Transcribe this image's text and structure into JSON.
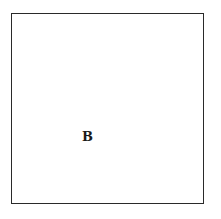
{
  "diagram": {
    "shape": "square",
    "label": "B",
    "colors": {
      "stroke": "#2a2a2a",
      "text": "#1a1a1a",
      "background": "#ffffff"
    }
  }
}
